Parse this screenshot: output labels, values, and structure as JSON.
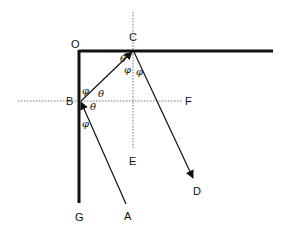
{
  "diagram": {
    "type": "reflection-geometry",
    "points": {
      "O": {
        "label": "O",
        "x": 79,
        "y": 51
      },
      "C": {
        "label": "C",
        "x": 133,
        "y": 51
      },
      "B": {
        "label": "B",
        "x": 80,
        "y": 101
      },
      "F": {
        "label": "F",
        "x": 189,
        "y": 101
      },
      "E": {
        "label": "E",
        "x": 133,
        "y": 161
      },
      "D": {
        "label": "D",
        "x": 197,
        "y": 191
      },
      "G": {
        "label": "G",
        "x": 79,
        "y": 217
      },
      "A": {
        "label": "A",
        "x": 128,
        "y": 216
      }
    },
    "angles": {
      "theta": "θ",
      "phi": "φ"
    },
    "edges": [
      {
        "from": "O",
        "to": "top-right",
        "style": "thick"
      },
      {
        "from": "O",
        "to": "G",
        "style": "thick"
      },
      {
        "from": "A",
        "to": "B",
        "style": "thin"
      },
      {
        "from": "B",
        "to": "C",
        "style": "thin-arrow"
      },
      {
        "from": "C",
        "to": "D",
        "style": "thin-arrow"
      },
      {
        "from": "B",
        "to": "F",
        "style": "dotted"
      },
      {
        "from": "C",
        "to": "E",
        "style": "dotted"
      }
    ]
  }
}
